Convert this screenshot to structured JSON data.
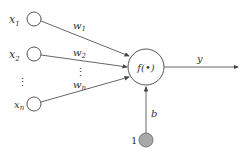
{
  "diagram": {
    "title": "",
    "inputs": [
      {
        "label": "x",
        "sub": "1",
        "weight": "w",
        "weight_sub": "1"
      },
      {
        "label": "x",
        "sub": "2",
        "weight": "w",
        "weight_sub": "2"
      },
      {
        "label": "x",
        "sub": "n",
        "weight": "w",
        "weight_sub": "n"
      }
    ],
    "ellipsis": "⋮",
    "neuron": {
      "label": "f(•)"
    },
    "output": {
      "label": "y"
    },
    "bias": {
      "label": "b",
      "input_value": "1"
    },
    "colors": {
      "stroke": "#555555",
      "bias_fill": "#a8a8a8",
      "text": "#333333"
    }
  }
}
